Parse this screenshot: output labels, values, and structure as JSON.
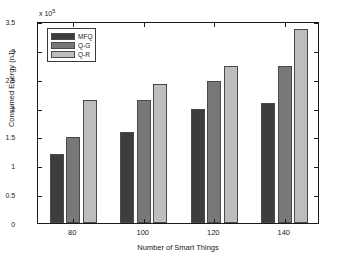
{
  "chart_data": {
    "type": "bar",
    "title": "",
    "xlabel": "Number of Smart Things",
    "ylabel": "Consumed Energy (nJ)",
    "y_exponent_prefix": "x 10",
    "y_exponent_power": "5",
    "y_multiplier": 100000,
    "categories": [
      "80",
      "100",
      "120",
      "140"
    ],
    "series": [
      {
        "name": "MFQ",
        "color": "#3d3d3d",
        "values": [
          1.2,
          1.6,
          2.0,
          2.1
        ]
      },
      {
        "name": "Q-G",
        "color": "#787878",
        "values": [
          1.5,
          2.15,
          2.48,
          2.75
        ]
      },
      {
        "name": "Q-R",
        "color": "#bdbdbd",
        "values": [
          2.15,
          2.44,
          2.75,
          3.4
        ]
      }
    ],
    "ylim": [
      0,
      3.5
    ],
    "ytick_labels": [
      "0",
      "0.5",
      "1",
      "1.5",
      "2",
      "2.5",
      "3",
      "3.5"
    ],
    "ytick_values": [
      0,
      0.5,
      1,
      1.5,
      2,
      2.5,
      3,
      3.5
    ],
    "grid": false,
    "legend_position": "top-left",
    "background_color": "#ffffff",
    "axis_color": "#1a1a1a"
  }
}
